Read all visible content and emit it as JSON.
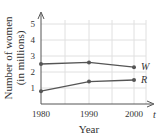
{
  "chart_data": {
    "type": "line",
    "title": "",
    "xlabel": "Year",
    "ylabel": "Number of women (in millions)",
    "ylabel_lines": [
      "Number of women",
      "(in millions)"
    ],
    "x_axis_var": "t",
    "categories": [
      "1980",
      "1990",
      "2000"
    ],
    "x": [
      1980,
      1990,
      2000
    ],
    "yticks": [
      "1",
      "2",
      "3",
      "4",
      "5"
    ],
    "ylim": [
      0,
      5.5
    ],
    "grid": true,
    "legend_position": "inline-right",
    "series": [
      {
        "name": "W",
        "values": [
          2.5,
          2.6,
          2.3
        ]
      },
      {
        "name": "R",
        "values": [
          0.8,
          1.4,
          1.5
        ]
      }
    ]
  },
  "colors": {
    "line": "#555555",
    "grid": "#e0e0e0",
    "axis": "#555555",
    "text": "#333333"
  }
}
